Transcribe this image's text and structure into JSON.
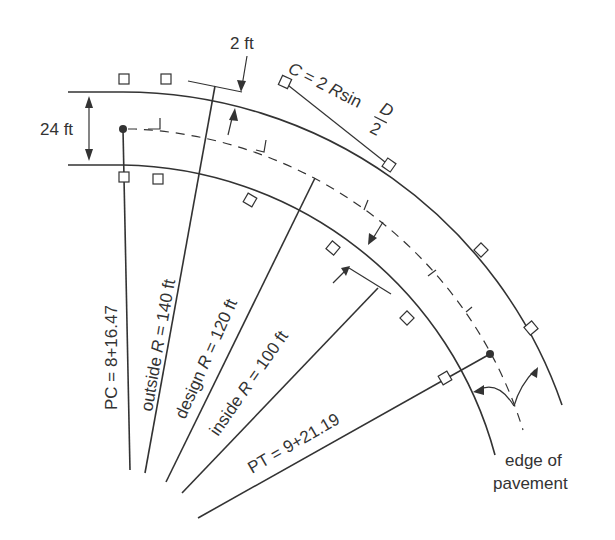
{
  "diagram": {
    "type": "horizontal-curve-plan-view",
    "colors": {
      "ink": "#333333",
      "background": "#ffffff"
    },
    "labels": {
      "offset_2ft": "2 ft",
      "width_24ft": "24 ft",
      "chord_C": "C",
      "chord_eq": " = 2 ",
      "chord_R": "R",
      "chord_sin": "sin",
      "chord_D": "D",
      "chord_2": "2",
      "pc_station": "PC = 8+16.47",
      "outside_prefix": "outside ",
      "outside_R": "R",
      "outside_value": " = 140 ft",
      "design_prefix": "design ",
      "design_R": "R",
      "design_value": " = 120 ft",
      "inside_prefix": "inside ",
      "inside_R": "R",
      "inside_value": " = 100 ft",
      "pt_station": "PT = 9+21.19",
      "edge_line1": "edge of",
      "edge_line2": "pavement"
    },
    "values": {
      "pavement_width_ft": 24,
      "stake_offset_ft": 2,
      "outside_radius_ft": 140,
      "design_radius_ft": 120,
      "inside_radius_ft": 100,
      "pc_station": "8+16.47",
      "pt_station": "9+21.19",
      "chord_formula": "C = 2 R sin D/2"
    }
  }
}
